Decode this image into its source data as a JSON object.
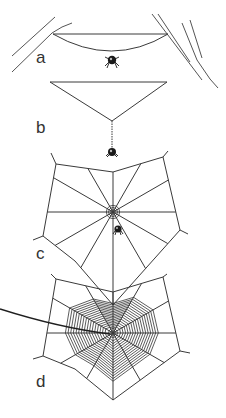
{
  "figure": {
    "panels": [
      {
        "id": "a",
        "label": "a",
        "stage": "bridge thread with sagging loop, spider hanging at center"
      },
      {
        "id": "b",
        "label": "b",
        "stage": "Y-shaped frame, spider dropping on vertical thread"
      },
      {
        "id": "c",
        "label": "c",
        "stage": "frame and radii complete, hub formed, spider near hub"
      },
      {
        "id": "d",
        "label": "d",
        "stage": "completed spiral web with signal thread"
      }
    ],
    "colors": {
      "ink": "#333333",
      "background": "#ffffff"
    },
    "web_c": {
      "radii_count": 12
    },
    "web_d": {
      "radii_count": 12,
      "spiral_turns": 16
    }
  }
}
